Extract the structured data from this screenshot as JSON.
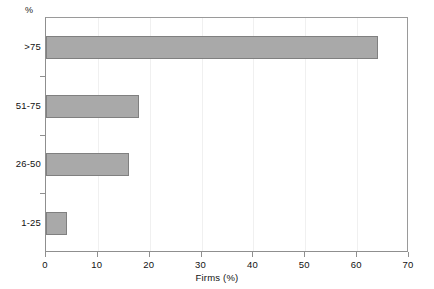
{
  "chart_data": {
    "type": "bar",
    "orientation": "horizontal",
    "title": "",
    "xlabel": "Firms (%)",
    "ylabel": "%",
    "categories": [
      ">75",
      "51-75",
      "26-50",
      "1-25"
    ],
    "values": [
      64,
      18,
      16,
      4
    ],
    "series": [
      {
        "name": "Firms (%)",
        "values": [
          64,
          18,
          16,
          4
        ]
      }
    ],
    "xlim": [
      0,
      70
    ],
    "xticks": [
      0,
      10,
      20,
      30,
      40,
      50,
      60,
      70
    ],
    "xtick_labels": [
      "0",
      "10",
      "20",
      "30",
      "40",
      "50",
      "60",
      "70"
    ],
    "grid": "vertical-faint",
    "legend": "none",
    "bar_fill_color": "#a9a9a9",
    "bar_border_color": "#808080",
    "axis_color": "#8f8f8f",
    "background_color": "#ffffff"
  }
}
